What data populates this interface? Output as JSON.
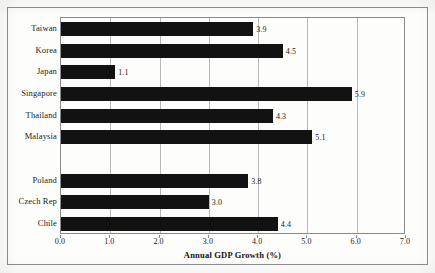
{
  "figure": {
    "background_color": "#fdfdfc",
    "frame_color": "#8e8e8e",
    "bar_color": "#121212",
    "gridline_color": "#b9b9b9",
    "axis_color": "#8a8a8a"
  },
  "chart_data": {
    "type": "bar",
    "orientation": "horizontal",
    "title": "",
    "xlabel": "Annual GDP Growth (%)",
    "ylabel": "",
    "xlim": [
      0.0,
      7.0
    ],
    "xticks": [
      "0.0",
      "1.0",
      "2.0",
      "3.0",
      "4.0",
      "5.0",
      "6.0",
      "7.0"
    ],
    "xtick_values": [
      0.0,
      1.0,
      2.0,
      3.0,
      4.0,
      5.0,
      6.0,
      7.0
    ],
    "grid": "vertical",
    "legend": "none",
    "categories": [
      "Taiwan",
      "Korea",
      "Japan",
      "Singapore",
      "Thailand",
      "Malaysia",
      "",
      "Poland",
      "Czech Rep",
      "Chile"
    ],
    "values": [
      3.9,
      4.5,
      1.1,
      5.9,
      4.3,
      5.1,
      null,
      3.8,
      3.0,
      4.4
    ],
    "data_labels": [
      "3.9",
      "4.5",
      "1.1",
      "5.9",
      "4.3",
      "5.1",
      "",
      "3.8",
      "3.0",
      "4.4"
    ],
    "bars": [
      {
        "category": "Taiwan",
        "value": 3.9,
        "label": "3.9"
      },
      {
        "category": "Korea",
        "value": 4.5,
        "label": "4.5"
      },
      {
        "category": "Japan",
        "value": 1.1,
        "label": "1.1"
      },
      {
        "category": "Singapore",
        "value": 5.9,
        "label": "5.9"
      },
      {
        "category": "Thailand",
        "value": 4.3,
        "label": "4.3"
      },
      {
        "category": "Malaysia",
        "value": 5.1,
        "label": "5.1"
      },
      {
        "category": "",
        "value": null,
        "label": ""
      },
      {
        "category": "Poland",
        "value": 3.8,
        "label": "3.8"
      },
      {
        "category": "Czech Rep",
        "value": 3.0,
        "label": "3.0"
      },
      {
        "category": "Chile",
        "value": 4.4,
        "label": "4.4"
      }
    ]
  }
}
